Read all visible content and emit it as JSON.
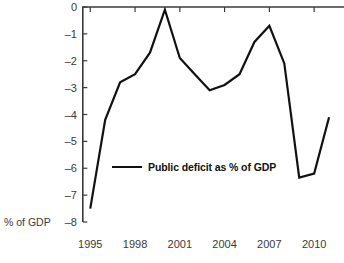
{
  "chart_data": {
    "type": "line",
    "title": "",
    "subtitle": "",
    "xlabel": "",
    "ylabel": "% of GDP",
    "xlim": [
      1994.5,
      2012.0
    ],
    "ylim": [
      -8,
      0
    ],
    "grid": false,
    "legend_position": "inside-center-left",
    "x_tick_labels": [
      "1995",
      "1998",
      "2001",
      "2004",
      "2007",
      "2010"
    ],
    "x_ticks": [
      1995,
      1998,
      2001,
      2004,
      2007,
      2010
    ],
    "y_tick_labels": [
      "0",
      "–1",
      "–2",
      "–3",
      "–4",
      "–5",
      "–6",
      "–7",
      "–8"
    ],
    "y_ticks": [
      0,
      -1,
      -2,
      -3,
      -4,
      -5,
      -6,
      -7,
      -8
    ],
    "series": [
      {
        "name": "Public deficit as % of GDP",
        "color": "#111111",
        "x": [
          1995,
          1996,
          1997,
          1998,
          1999,
          2000,
          2001,
          2002,
          2003,
          2004,
          2005,
          2006,
          2007,
          2008,
          2009,
          2010,
          2011
        ],
        "values": [
          -7.5,
          -4.2,
          -2.8,
          -2.5,
          -1.7,
          -0.1,
          -1.9,
          -2.5,
          -3.1,
          -2.9,
          -2.5,
          -1.3,
          -0.7,
          -2.1,
          -6.35,
          -6.2,
          -4.1
        ]
      }
    ]
  },
  "legend": {
    "label": "Public deficit as % of GDP"
  },
  "axis": {
    "y_title": "% of GDP"
  }
}
